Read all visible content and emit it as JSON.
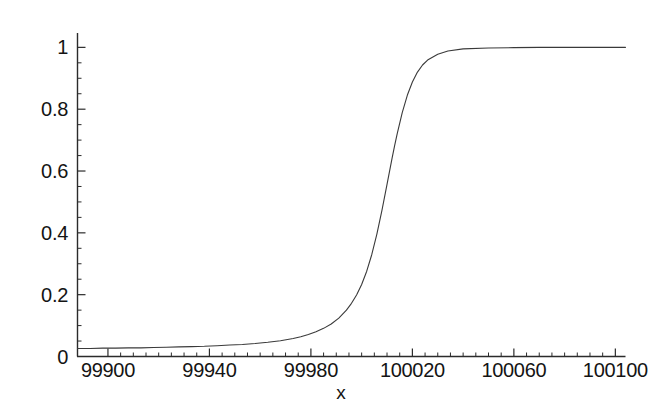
{
  "chart_data": {
    "type": "line",
    "title": "",
    "subtitle": "",
    "xlabel": "x",
    "ylabel": "",
    "xlim": [
      99888,
      100104
    ],
    "ylim": [
      0,
      1.04
    ],
    "grid": false,
    "legend": null,
    "annotations": [],
    "x_ticks": [
      {
        "value": 99900,
        "label": "99900"
      },
      {
        "value": 99940,
        "label": "99940"
      },
      {
        "value": 99980,
        "label": "99980"
      },
      {
        "value": 100020,
        "label": "100020"
      },
      {
        "value": 100060,
        "label": "100060"
      },
      {
        "value": 100100,
        "label": "100100"
      }
    ],
    "x_minor_step": 5,
    "y_ticks": [
      {
        "value": 0,
        "label": "0"
      },
      {
        "value": 0.2,
        "label": "0.2"
      },
      {
        "value": 0.4,
        "label": "0.4"
      },
      {
        "value": 0.6,
        "label": "0.6"
      },
      {
        "value": 0.8,
        "label": "0.8"
      },
      {
        "value": 1,
        "label": "1"
      }
    ],
    "y_minor_step": 0.05,
    "series": [
      {
        "name": "curve",
        "color": "#3a3a3a",
        "line_width": 1.1,
        "description": "sigmoid rising from ~0.027 to 1.0 with midpoint near x=100013",
        "x": [
          99888,
          99893,
          99898,
          99903,
          99908,
          99913,
          99918,
          99923,
          99928,
          99933,
          99938,
          99943,
          99948,
          99953,
          99958,
          99963,
          99968,
          99973,
          99976,
          99979,
          99982,
          99985,
          99988,
          99991,
          99994,
          99996,
          99998,
          100000,
          100002,
          100004,
          100006,
          100008,
          100010,
          100012,
          100013,
          100014,
          100016,
          100018,
          100020,
          100022,
          100024,
          100026,
          100030,
          100034,
          100040,
          100050,
          100060,
          100070,
          100080,
          100090,
          100100,
          100104
        ],
        "y": [
          0.026,
          0.026,
          0.027,
          0.027,
          0.028,
          0.028,
          0.029,
          0.03,
          0.031,
          0.032,
          0.033,
          0.035,
          0.037,
          0.039,
          0.042,
          0.046,
          0.051,
          0.058,
          0.064,
          0.071,
          0.08,
          0.091,
          0.105,
          0.124,
          0.15,
          0.172,
          0.199,
          0.233,
          0.276,
          0.33,
          0.396,
          0.473,
          0.557,
          0.642,
          0.682,
          0.72,
          0.789,
          0.845,
          0.888,
          0.92,
          0.943,
          0.959,
          0.978,
          0.988,
          0.995,
          0.998,
          0.999,
          1.0,
          1.0,
          1.0,
          1.0,
          1.0
        ]
      }
    ]
  },
  "axes": {
    "x_axis_name": "x-axis",
    "y_axis_name": "y-axis"
  }
}
